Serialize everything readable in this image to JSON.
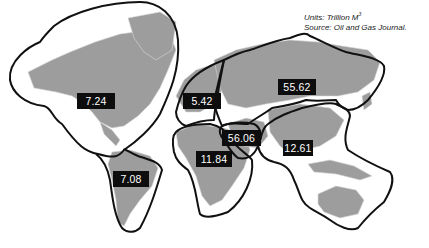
{
  "legend": {
    "units_label": "Units: Trillion M",
    "units_superscript": "3",
    "source": "Source: Oil and Gas Journal."
  },
  "regions": [
    {
      "name": "North America",
      "value": "7.24"
    },
    {
      "name": "South America",
      "value": "7.08"
    },
    {
      "name": "Europe",
      "value": "5.42"
    },
    {
      "name": "Former Soviet Union",
      "value": "55.62"
    },
    {
      "name": "Middle East",
      "value": "56.06"
    },
    {
      "name": "Africa",
      "value": "11.84"
    },
    {
      "name": "Asia Pacific",
      "value": "12.61"
    }
  ],
  "colors": {
    "land": "#9a9a9a",
    "land_light": "#cfcfcf",
    "outline": "#111111",
    "label_bg": "#0d0d0d",
    "label_text": "#ffffff"
  }
}
